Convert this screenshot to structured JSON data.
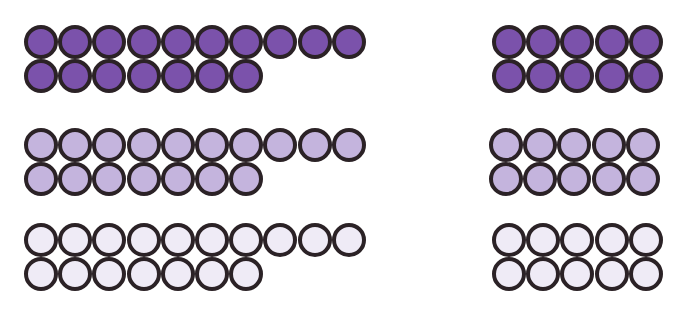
{
  "diagram": {
    "stroke_color": "#2b2226",
    "shades": {
      "dark": "#7b52ab",
      "medium": "#c4b4dd",
      "light": "#efebf6"
    },
    "groups": [
      {
        "id": "dark-left",
        "shade": "dark",
        "count": 17,
        "rows": [
          10,
          7
        ],
        "x": 24,
        "y": 25
      },
      {
        "id": "dark-right",
        "shade": "dark",
        "count": 10,
        "rows": [
          5,
          5
        ],
        "x": 492,
        "y": 25
      },
      {
        "id": "medium-left",
        "shade": "medium",
        "count": 17,
        "rows": [
          10,
          7
        ],
        "x": 24,
        "y": 128
      },
      {
        "id": "medium-right",
        "shade": "medium",
        "count": 10,
        "rows": [
          5,
          5
        ],
        "x": 489,
        "y": 128
      },
      {
        "id": "light-left",
        "shade": "light",
        "count": 17,
        "rows": [
          10,
          7
        ],
        "x": 24,
        "y": 223
      },
      {
        "id": "light-right",
        "shade": "light",
        "count": 10,
        "rows": [
          5,
          5
        ],
        "x": 492,
        "y": 223
      }
    ]
  }
}
